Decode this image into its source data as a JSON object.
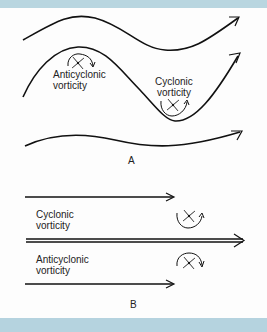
{
  "colors": {
    "border_band": "#b9d6e0",
    "line": "#111111",
    "background": "#fdfdfd"
  },
  "panel_a": {
    "caption": "A",
    "labels": {
      "anticyclonic_line1": "Anticyclonic",
      "anticyclonic_line2": "vorticity",
      "cyclonic_line1": "Cyclonic",
      "cyclonic_line2": "vorticity"
    },
    "icons": [
      "pinwheel-anticyclonic-icon",
      "pinwheel-cyclonic-icon"
    ]
  },
  "panel_b": {
    "caption": "B",
    "labels": {
      "cyclonic_line1": "Cyclonic",
      "cyclonic_line2": "vorticity",
      "anticyclonic_line1": "Anticyclonic",
      "anticyclonic_line2": "vorticity"
    },
    "icons": [
      "pinwheel-cyclonic-icon",
      "pinwheel-anticyclonic-icon"
    ]
  }
}
